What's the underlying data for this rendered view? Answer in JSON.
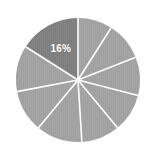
{
  "chart_data": {
    "type": "pie",
    "title": "",
    "subtitle": "",
    "xlabel": "",
    "ylabel": "",
    "grid": false,
    "legend": "none",
    "center": {
      "x": 78,
      "y": 80
    },
    "radius": 62,
    "start_angle_deg": -90,
    "direction": "counterclockwise",
    "divider_color": "#ffffff",
    "divider_width_px": 1.6,
    "background_color": "#ffffff",
    "highlight_color": "#7d7d7d",
    "base_color": "#a0a0a0",
    "categories": [
      "Slice 1",
      "Slice 2",
      "Slice 3",
      "Slice 4",
      "Slice 5",
      "Slice 6",
      "Slice 7",
      "Slice 8",
      "Slice 9"
    ],
    "values": [
      16,
      12,
      11,
      12,
      10,
      10,
      10,
      10,
      9
    ],
    "labels": [
      "16%",
      "",
      "",
      "",
      "",
      "",
      "",
      "",
      ""
    ],
    "highlighted_index": 0,
    "slices": [
      {
        "name": "Slice 1",
        "value": 16,
        "label": "16%",
        "highlighted": true,
        "start_deg": -90,
        "sweep_deg": -57.6,
        "color": "#7d7d7d",
        "label_radius_frac": 0.58
      },
      {
        "name": "Slice 2",
        "value": 12,
        "label": "",
        "highlighted": false,
        "start_deg": -147.6,
        "sweep_deg": -43.2,
        "color": "#a0a0a0",
        "label_radius_frac": 0.58
      },
      {
        "name": "Slice 3",
        "value": 11,
        "label": "",
        "highlighted": false,
        "start_deg": -190.8,
        "sweep_deg": -39.6,
        "color": "#a0a0a0",
        "label_radius_frac": 0.58
      },
      {
        "name": "Slice 4",
        "value": 12,
        "label": "",
        "highlighted": false,
        "start_deg": -230.4,
        "sweep_deg": -43.2,
        "color": "#a0a0a0",
        "label_radius_frac": 0.58
      },
      {
        "name": "Slice 5",
        "value": 10,
        "label": "",
        "highlighted": false,
        "start_deg": -273.6,
        "sweep_deg": -36.0,
        "color": "#a0a0a0",
        "label_radius_frac": 0.58
      },
      {
        "name": "Slice 6",
        "value": 10,
        "label": "",
        "highlighted": false,
        "start_deg": -309.6,
        "sweep_deg": -36.0,
        "color": "#a0a0a0",
        "label_radius_frac": 0.58
      },
      {
        "name": "Slice 7",
        "value": 10,
        "label": "",
        "highlighted": false,
        "start_deg": -345.6,
        "sweep_deg": -36.0,
        "color": "#a0a0a0",
        "label_radius_frac": 0.58
      },
      {
        "name": "Slice 8",
        "value": 10,
        "label": "",
        "highlighted": false,
        "start_deg": -381.6,
        "sweep_deg": -36.0,
        "color": "#a0a0a0",
        "label_radius_frac": 0.58
      },
      {
        "name": "Slice 9",
        "value": 9,
        "label": "",
        "highlighted": false,
        "start_deg": -417.6,
        "sweep_deg": -32.4,
        "color": "#a0a0a0",
        "label_radius_frac": 0.58
      }
    ]
  }
}
